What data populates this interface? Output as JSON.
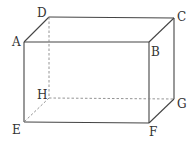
{
  "diagram": {
    "type": "rectangular-prism",
    "colors": {
      "solid_edge": "#444444",
      "hidden_edge": "#888888",
      "label": "#333333"
    },
    "vertices": {
      "A": {
        "x": 24,
        "y": 42,
        "label": "A"
      },
      "B": {
        "x": 149,
        "y": 42,
        "label": "B"
      },
      "C": {
        "x": 174,
        "y": 18,
        "label": "C"
      },
      "D": {
        "x": 49,
        "y": 17,
        "label": "D"
      },
      "E": {
        "x": 24,
        "y": 122,
        "label": "E"
      },
      "F": {
        "x": 149,
        "y": 123,
        "label": "F"
      },
      "G": {
        "x": 174,
        "y": 99,
        "label": "G"
      },
      "H": {
        "x": 49,
        "y": 98,
        "label": "H"
      }
    },
    "solid_edges": [
      "AB",
      "BF",
      "FE",
      "EA",
      "AD",
      "DC",
      "CB",
      "CG",
      "GF"
    ],
    "hidden_edges": [
      "DH",
      "HE",
      "HG"
    ]
  }
}
